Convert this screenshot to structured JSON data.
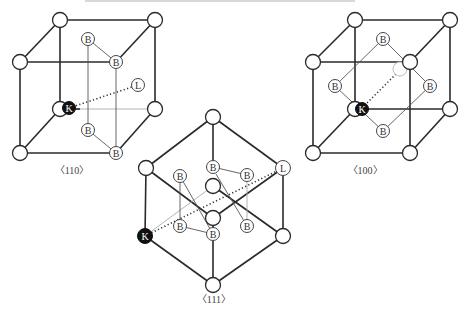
{
  "figure": {
    "top_text_cropped": "",
    "labels": {
      "B": "B",
      "K": "K",
      "L": "L"
    },
    "captions": {
      "left": "〈110〉",
      "middle": "〈111〉",
      "right": "〈100〉"
    },
    "panels": [
      {
        "id": "left",
        "direction": "〈110〉",
        "shape": "cube"
      },
      {
        "id": "middle",
        "direction": "〈111〉",
        "shape": "hexagon projection"
      },
      {
        "id": "right",
        "direction": "〈100〉",
        "shape": "cube"
      }
    ]
  }
}
